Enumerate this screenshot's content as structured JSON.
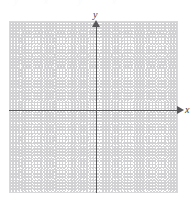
{
  "figure": {
    "kind": "cartesian-coordinate-grid",
    "width": 196,
    "height": 204,
    "background_color": "#ffffff"
  },
  "chart_data": {
    "type": "scatter",
    "title": "",
    "subtitle": "",
    "xlabel": "x",
    "ylabel": "y",
    "series": [],
    "x": [],
    "values": [],
    "xlim": [
      -8,
      7
    ],
    "ylim": [
      -7,
      8
    ],
    "grid": true,
    "grid_style": "dotted",
    "grid_color": "#d4d4d6",
    "grid_spacing_px": 11.3,
    "grid_columns": 15,
    "grid_rows": 15,
    "legend_position": "none",
    "axis_color": "#58585a",
    "origin_px": {
      "x": 96,
      "y": 110
    },
    "annotations": [],
    "tick_labels": {
      "x": [],
      "y": []
    }
  },
  "axes": {
    "x": {
      "label": "x",
      "arrow_direction": "right",
      "color": "#58585a",
      "start_px": 9,
      "end_px": 180,
      "y_px": 110
    },
    "y": {
      "label": "y",
      "arrow_direction": "up",
      "color": "#58585a",
      "start_px": 193,
      "end_px": 22,
      "x_px": 96
    }
  },
  "grid": {
    "left_px": 9,
    "top_px": 21,
    "width_px": 169,
    "height_px": 172,
    "line_color": "#d4d4d6",
    "border_color": "#d9d9db",
    "columns": 15,
    "rows": 15,
    "cell_size_px": 11.3
  },
  "top_artifact": {
    "fragments": [
      "y",
      "x",
      "y",
      "x"
    ],
    "color": "#fbfbfc",
    "note": "clipped faint text remnants along the top edge"
  }
}
